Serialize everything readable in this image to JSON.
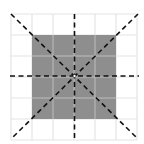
{
  "diagram": {
    "grid": {
      "rows": 6,
      "cols": 6,
      "origin_x": 11,
      "origin_y": 14,
      "cell": 21,
      "line_color": "#e4e4e4"
    },
    "square": {
      "col": 1,
      "row": 1,
      "size_cells": 4,
      "fill": "#8e8e8e",
      "inner_line_color": "#bdbdbd"
    },
    "center": {
      "x": 74.5,
      "y": 76
    },
    "symmetry_lines": [
      {
        "name": "vertical",
        "x1": 74.5,
        "y1": 14,
        "x2": 74.5,
        "y2": 140
      },
      {
        "name": "horizontal",
        "x1": 10,
        "y1": 76,
        "x2": 139,
        "y2": 76
      },
      {
        "name": "diagonal-main",
        "x1": 11,
        "y1": 14,
        "x2": 138,
        "y2": 139
      },
      {
        "name": "diagonal-anti",
        "x1": 138,
        "y1": 14,
        "x2": 11,
        "y2": 139
      }
    ],
    "dash_color": "#111111"
  }
}
